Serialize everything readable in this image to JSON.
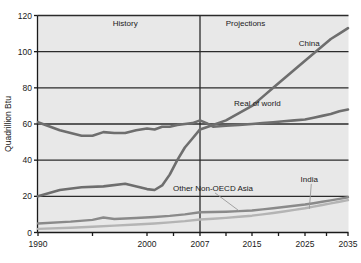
{
  "chart_data": {
    "type": "line",
    "title": "",
    "xlabel": "",
    "ylabel": "Quadrillion Btu",
    "xlim": [
      1990,
      2035
    ],
    "ylim": [
      0,
      120
    ],
    "grid": true,
    "legend_position": "inline-annotations",
    "xticks": [
      1990,
      2000,
      2007,
      2015,
      2025,
      2035
    ],
    "xtick_labels": [
      "1990",
      "2000",
      "2007",
      "2015",
      "2025",
      "2035"
    ],
    "yticks": [
      0,
      20,
      40,
      60,
      80,
      100,
      120
    ],
    "ytick_labels": [
      "0",
      "20",
      "40",
      "60",
      "80",
      "100",
      "120"
    ],
    "region_divider_x": 2007,
    "region_labels": [
      {
        "name": "history-label",
        "text": "History",
        "x": 1998,
        "y": 114
      },
      {
        "name": "projections-label",
        "text": "Projections",
        "x": 2014,
        "y": 114
      }
    ],
    "series": [
      {
        "name": "China",
        "label": "China",
        "color": "#6e6e6e",
        "width": 2.6,
        "label_x": 2026,
        "label_y": 103,
        "x": [
          1990,
          1992,
          1994,
          1996,
          1998,
          2000,
          2001,
          2002,
          2003,
          2004,
          2005,
          2006,
          2007,
          2009,
          2011,
          2013,
          2015,
          2017,
          2019,
          2021,
          2023,
          2025,
          2027,
          2029,
          2031,
          2033,
          2035
        ],
        "values": [
          20,
          23.5,
          25,
          25.5,
          27,
          24,
          23.5,
          26,
          32,
          40,
          47,
          52,
          57,
          59.5,
          62,
          66,
          70,
          75,
          80,
          85,
          90,
          95,
          99,
          103,
          107,
          110,
          113
        ]
      },
      {
        "name": "Rest of world",
        "label": "Real of world",
        "color": "#6e6e6e",
        "width": 2.6,
        "label_x": 2016,
        "label_y": 70,
        "x": [
          1990,
          1992,
          1994,
          1995,
          1996,
          1997,
          1998,
          1999,
          2000,
          2001,
          2002,
          2003,
          2004,
          2005,
          2006,
          2007,
          2008,
          2009,
          2011,
          2013,
          2015,
          2017,
          2019,
          2021,
          2023,
          2025,
          2027,
          2029,
          2031,
          2033,
          2035
        ],
        "values": [
          61,
          56.5,
          53.5,
          53.5,
          55.5,
          55,
          55,
          56.5,
          57.5,
          57,
          58.5,
          58.5,
          59.5,
          60,
          60.5,
          62,
          60.5,
          58.5,
          59,
          59.5,
          60,
          60.5,
          61,
          61.5,
          62,
          62.5,
          63.5,
          64.5,
          65.5,
          67,
          68
        ]
      },
      {
        "name": "Other Non-OECD Asia",
        "label": "Other Non-OECD Asia",
        "color": "#8a8a8a",
        "width": 2.4,
        "label_x": 2009,
        "label_y": 23,
        "leader_to_x": 2013,
        "leader_to_y": 12,
        "x": [
          1990,
          1993,
          1995,
          1996,
          1997,
          1999,
          2001,
          2003,
          2005,
          2007,
          2009,
          2011,
          2013,
          2015,
          2017,
          2019,
          2021,
          2023,
          2025,
          2027,
          2029,
          2031,
          2033,
          2035
        ],
        "values": [
          5,
          6,
          7,
          8.3,
          7.5,
          8,
          8.6,
          9.2,
          10,
          11.2,
          11.3,
          11.5,
          11.8,
          12.2,
          12.8,
          13.4,
          14.1,
          14.8,
          15.5,
          16.2,
          17,
          17.8,
          18.6,
          19.5
        ]
      },
      {
        "name": "India",
        "label": "India",
        "color": "#b4b4b4",
        "width": 2.4,
        "label_x": 2026,
        "label_y": 28,
        "leader_to_x": 2026,
        "leader_to_y": 13,
        "x": [
          1990,
          1993,
          1995,
          1997,
          1999,
          2001,
          2003,
          2005,
          2007,
          2009,
          2011,
          2013,
          2015,
          2017,
          2019,
          2021,
          2023,
          2025,
          2027,
          2029,
          2031,
          2033,
          2035
        ],
        "values": [
          2,
          2.6,
          3.2,
          3.8,
          4.4,
          5,
          5.6,
          6.3,
          7.2,
          7.6,
          8.1,
          8.7,
          9.3,
          10,
          10.8,
          11.6,
          12.5,
          13.4,
          14.3,
          15.2,
          16.1,
          17,
          17.9
        ]
      }
    ],
    "colors": {
      "plot_background": "#e8e8e8",
      "grid": "#2b2b2b",
      "axis": "#1a1a1a",
      "page_background": "#ffffff"
    }
  }
}
